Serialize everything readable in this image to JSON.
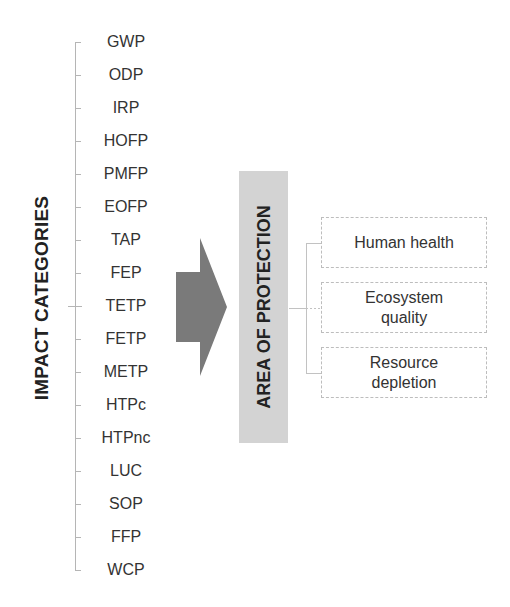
{
  "impact_categories": {
    "heading": "IMPACT CATEGORIES",
    "items": [
      "GWP",
      "ODP",
      "IRP",
      "HOFP",
      "PMFP",
      "EOFP",
      "TAP",
      "FEP",
      "TETP",
      "FETP",
      "METP",
      "HTPc",
      "HTPnc",
      "LUC",
      "SOP",
      "FFP",
      "WCP"
    ]
  },
  "arrow": {
    "color": "#7a7a7a",
    "direction": "right"
  },
  "area_of_protection": {
    "heading": "AREA OF PROTECTION",
    "bar_color": "#d3d3d3",
    "items": [
      "Human health",
      "Ecosystem quality",
      "Resource depletion"
    ]
  }
}
